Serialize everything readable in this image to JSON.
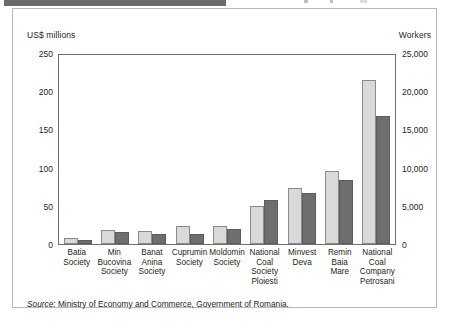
{
  "topbar": {
    "tab_label": "",
    "note": "cut-off header strip"
  },
  "chart_data": {
    "type": "bar",
    "title": "",
    "subtitle": "",
    "categories": [
      "Batia Society",
      "Min Bucovina Society",
      "Banat Anina Society",
      "Cuprumin Society",
      "Moldomin Society",
      "National Coal Society Ploiesti",
      "Minvest Deva",
      "Remin Baia Mare",
      "National Coal Company Petrosani"
    ],
    "category_lines": [
      [
        "Batia",
        "Society"
      ],
      [
        "Min",
        "Bucovina",
        "Society"
      ],
      [
        "Banat",
        "Anina",
        "Society"
      ],
      [
        "Cuprumin",
        "Society"
      ],
      [
        "Moldomin",
        "Society"
      ],
      [
        "National",
        "Coal",
        "Society",
        "Ploiesti"
      ],
      [
        "Minvest",
        "Deva"
      ],
      [
        "Remin",
        "Baia",
        "Mare"
      ],
      [
        "National",
        "Coal",
        "Company",
        "Petrosani"
      ]
    ],
    "series": [
      {
        "name": "US$ millions",
        "axis": "left",
        "color": "#d9d9d9",
        "values": [
          8,
          18,
          17,
          24,
          24,
          50,
          73,
          95,
          215
        ]
      },
      {
        "name": "Workers",
        "axis": "right",
        "color": "#6e6e6e",
        "values": [
          500,
          1600,
          1300,
          1300,
          1900,
          5800,
          6700,
          8400,
          16800
        ]
      }
    ],
    "left_axis": {
      "label": "US$ millions",
      "ticks": [
        "0",
        "50",
        "100",
        "150",
        "200",
        "250"
      ],
      "tick_values": [
        0,
        50,
        100,
        150,
        200,
        250
      ],
      "min": 0,
      "max": 250
    },
    "right_axis": {
      "label": "Workers",
      "ticks": [
        "0",
        "5,000",
        "10,000",
        "15,000",
        "20,000",
        "25,000"
      ],
      "tick_values": [
        0,
        5000,
        10000,
        15000,
        20000,
        25000
      ],
      "min": 0,
      "max": 25000
    },
    "xlabel": "",
    "grid": false,
    "legend": "none"
  },
  "source": {
    "prefix": "Source:",
    "text": " Ministry of Economy and Commerce, Government of Romania."
  }
}
